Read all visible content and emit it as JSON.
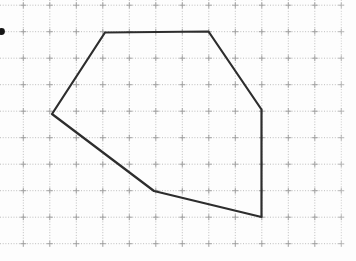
{
  "figure": {
    "canvas": {
      "width": 356,
      "height": 261,
      "background": "#fdfdfd"
    },
    "grid": {
      "origin_x": 23.3,
      "origin_y": 5.2,
      "spacing": 26.5,
      "cols": 13,
      "rows": 10,
      "h_extent_x": [
        0,
        345
      ],
      "v_extent_y": [
        0,
        246.5
      ],
      "dot_color": "#bdbdbd",
      "cross_color": "#9d9d9d",
      "cross_arm": 3
    },
    "bullet": {
      "cx": 1.5,
      "cy": 31.5,
      "r": 3.4,
      "color": "#151515"
    },
    "polygon": {
      "stroke": "#2d2d2d",
      "stroke_width": 2.2,
      "vertices_px": [
        [
          105,
          32.5
        ],
        [
          208.5,
          31.5
        ],
        [
          261.5,
          109.5
        ],
        [
          261.5,
          217
        ],
        [
          154,
          191
        ],
        [
          52,
          114
        ]
      ],
      "vertices_grid_units": [
        [
          3,
          1
        ],
        [
          7,
          1
        ],
        [
          9,
          4
        ],
        [
          9,
          8
        ],
        [
          5,
          7
        ],
        [
          1,
          4
        ]
      ]
    }
  }
}
